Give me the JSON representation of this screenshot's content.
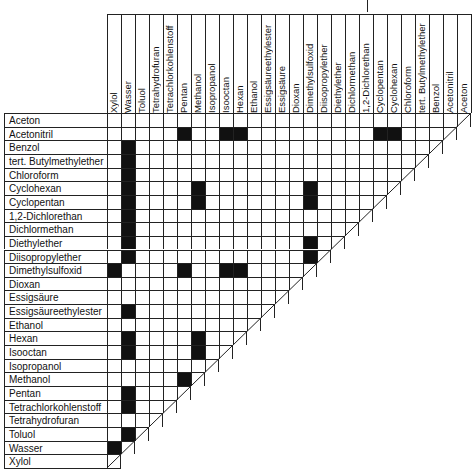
{
  "chart_data": {
    "type": "heatmap",
    "title": "",
    "rows": [
      "Aceton",
      "Acetonitril",
      "Benzol",
      "tert. Butylmethylether",
      "Chloroform",
      "Cyclohexan",
      "Cyclopentan",
      "1,2-Dichlorethan",
      "Dichlormethan",
      "Diethylether",
      "Diisopropylether",
      "Dimethylsulfoxid",
      "Dioxan",
      "Essigsäure",
      "Essigsäureethylester",
      "Ethanol",
      "Hexan",
      "Isooctan",
      "Isopropanol",
      "Methanol",
      "Pentan",
      "Tetrachlorkohlenstoff",
      "Tetrahydrofuran",
      "Toluol",
      "Wasser",
      "Xylol"
    ],
    "columns": [
      "Xylol",
      "Wasser",
      "Toluol",
      "Tetrahydrofuran",
      "Tetrachlorkohlenstoff",
      "Pentan",
      "Methanol",
      "Isopropanol",
      "Isooctan",
      "Hexan",
      "Ethanol",
      "Essigsäureethylester",
      "Essigsäure",
      "Dioxan",
      "Dimethylsulfoxid",
      "Diisopropylether",
      "Diethylether",
      "Dichlormethan",
      "1,2-Dichlorethan",
      "Cyclopentan",
      "Cyclohexan",
      "Chloroform",
      "tert. Butylmethylether",
      "Benzol",
      "Acetonitril",
      "Aceton"
    ],
    "immiscible_pairs": [
      [
        "Acetonitril",
        "Pentan"
      ],
      [
        "Acetonitril",
        "Isooctan"
      ],
      [
        "Acetonitril",
        "Hexan"
      ],
      [
        "Acetonitril",
        "Cyclopentan"
      ],
      [
        "Acetonitril",
        "Cyclohexan"
      ],
      [
        "Benzol",
        "Wasser"
      ],
      [
        "tert. Butylmethylether",
        "Wasser"
      ],
      [
        "Chloroform",
        "Wasser"
      ],
      [
        "Cyclohexan",
        "Wasser"
      ],
      [
        "Cyclohexan",
        "Methanol"
      ],
      [
        "Cyclohexan",
        "Dimethylsulfoxid"
      ],
      [
        "Cyclopentan",
        "Wasser"
      ],
      [
        "Cyclopentan",
        "Methanol"
      ],
      [
        "Cyclopentan",
        "Dimethylsulfoxid"
      ],
      [
        "1,2-Dichlorethan",
        "Wasser"
      ],
      [
        "Dichlormethan",
        "Wasser"
      ],
      [
        "Diethylether",
        "Wasser"
      ],
      [
        "Diethylether",
        "Dimethylsulfoxid"
      ],
      [
        "Diisopropylether",
        "Wasser"
      ],
      [
        "Diisopropylether",
        "Dimethylsulfoxid"
      ],
      [
        "Dimethylsulfoxid",
        "Xylol"
      ],
      [
        "Dimethylsulfoxid",
        "Pentan"
      ],
      [
        "Dimethylsulfoxid",
        "Isooctan"
      ],
      [
        "Dimethylsulfoxid",
        "Hexan"
      ],
      [
        "Essigsäureethylester",
        "Wasser"
      ],
      [
        "Hexan",
        "Wasser"
      ],
      [
        "Hexan",
        "Methanol"
      ],
      [
        "Isooctan",
        "Wasser"
      ],
      [
        "Isooctan",
        "Methanol"
      ],
      [
        "Methanol",
        "Pentan"
      ],
      [
        "Pentan",
        "Wasser"
      ],
      [
        "Tetrachlorkohlenstoff",
        "Wasser"
      ],
      [
        "Toluol",
        "Wasser"
      ],
      [
        "Wasser",
        "Xylol"
      ]
    ],
    "legend": "black = not miscible, white = miscible",
    "layout": {
      "grid": true,
      "shape": "lower-triangular",
      "legend_position": "none"
    }
  },
  "colors": {
    "filled": "#111111",
    "empty": "#ffffff",
    "grid": "#222222"
  }
}
